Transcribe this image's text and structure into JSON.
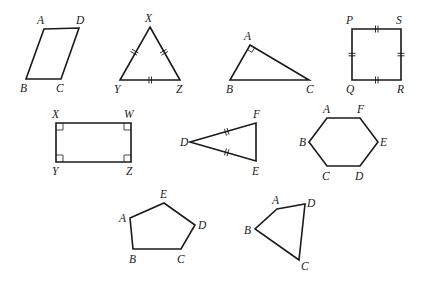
{
  "figures": [
    {
      "id": "parallelogram-abcd",
      "name": "parallelogram",
      "vertices": [
        "A",
        "D",
        "C",
        "B"
      ],
      "labels": [
        "A",
        "D",
        "C",
        "B"
      ],
      "markings": []
    },
    {
      "id": "triangle-xyz",
      "name": "equilateral-triangle",
      "vertices": [
        "X",
        "Z",
        "Y"
      ],
      "labels": [
        "X",
        "Z",
        "Y"
      ],
      "markings": [
        "congruent-ticks: XY, XZ, YZ (double)"
      ]
    },
    {
      "id": "triangle-abc",
      "name": "right-triangle",
      "vertices": [
        "A",
        "C",
        "B"
      ],
      "labels": [
        "A",
        "C",
        "B"
      ],
      "markings": [
        "right-angle at A"
      ]
    },
    {
      "id": "square-pqrs",
      "name": "square",
      "vertices": [
        "P",
        "S",
        "R",
        "Q"
      ],
      "labels": [
        "P",
        "S",
        "R",
        "Q"
      ],
      "markings": [
        "congruent-ticks: PS, SR, RQ, QP (double)"
      ]
    },
    {
      "id": "rectangle-xwzy",
      "name": "rectangle",
      "vertices": [
        "X",
        "W",
        "Z",
        "Y"
      ],
      "labels": [
        "X",
        "W",
        "Z",
        "Y"
      ],
      "markings": [
        "right-angles at X, W, Z, Y"
      ]
    },
    {
      "id": "triangle-def",
      "name": "isosceles-triangle",
      "vertices": [
        "D",
        "F",
        "E"
      ],
      "labels": [
        "D",
        "F",
        "E"
      ],
      "markings": [
        "congruent-ticks: DF, DE (double)"
      ]
    },
    {
      "id": "hexagon-abcdef",
      "name": "hexagon",
      "vertices": [
        "A",
        "F",
        "E",
        "D",
        "C",
        "B"
      ],
      "labels": [
        "A",
        "F",
        "E",
        "D",
        "C",
        "B"
      ],
      "markings": []
    },
    {
      "id": "pentagon-abcde",
      "name": "pentagon",
      "vertices": [
        "E",
        "D",
        "C",
        "B",
        "A"
      ],
      "labels": [
        "E",
        "D",
        "C",
        "B",
        "A"
      ],
      "markings": []
    },
    {
      "id": "quadrilateral-abcd",
      "name": "quadrilateral",
      "vertices": [
        "A",
        "D",
        "C",
        "B"
      ],
      "labels": [
        "A",
        "D",
        "C",
        "B"
      ],
      "markings": []
    }
  ]
}
